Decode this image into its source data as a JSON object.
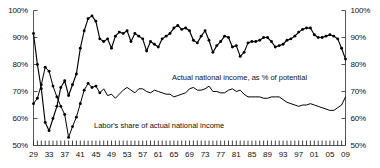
{
  "chart_data": {
    "type": "line",
    "title": "",
    "xlabel": "",
    "ylabel": "",
    "ylim": [
      50,
      100
    ],
    "xlim": [
      1929,
      2009
    ],
    "grid": false,
    "legend_position": "inline-annotation",
    "y_tick_labels": [
      "100%",
      "90%",
      "80%",
      "70%",
      "60%",
      "50%"
    ],
    "y_ticks": [
      100,
      90,
      80,
      70,
      60,
      50
    ],
    "y_axis_right_tick_labels": [
      "100%",
      "90%",
      "80%",
      "70%",
      "60%",
      "50%"
    ],
    "x_tick_labels": [
      "29",
      "33",
      "37",
      "41",
      "45",
      "49",
      "53",
      "57",
      "61",
      "65",
      "69",
      "73",
      "77",
      "81",
      "85",
      "89",
      "93",
      "97",
      "01",
      "05",
      "09"
    ],
    "x_ticks": [
      1929,
      1933,
      1937,
      1941,
      1945,
      1949,
      1953,
      1957,
      1961,
      1965,
      1969,
      1973,
      1977,
      1981,
      1985,
      1989,
      1993,
      1997,
      2001,
      2005,
      2009
    ],
    "minor_ticks": "annual",
    "annotations": [
      {
        "text": "Actual national income, as % of potential",
        "series": "actual_national_income"
      },
      {
        "text": "Labor's share of actual national income",
        "series": "labor_share"
      }
    ],
    "x": [
      1929,
      1930,
      1931,
      1932,
      1933,
      1934,
      1935,
      1936,
      1937,
      1938,
      1939,
      1940,
      1941,
      1942,
      1943,
      1944,
      1945,
      1946,
      1947,
      1948,
      1949,
      1950,
      1951,
      1952,
      1953,
      1954,
      1955,
      1956,
      1957,
      1958,
      1959,
      1960,
      1961,
      1962,
      1963,
      1964,
      1965,
      1966,
      1967,
      1968,
      1969,
      1970,
      1971,
      1972,
      1973,
      1974,
      1975,
      1976,
      1977,
      1978,
      1979,
      1980,
      1981,
      1982,
      1983,
      1984,
      1985,
      1986,
      1987,
      1988,
      1989,
      1990,
      1991,
      1992,
      1993,
      1994,
      1995,
      1996,
      1997,
      1998,
      1999,
      2000,
      2001,
      2002,
      2003,
      2004,
      2005,
      2006,
      2007,
      2008,
      2009
    ],
    "series": [
      {
        "name": "Actual national income, as % of potential",
        "marker": "filled-diamond",
        "values": [
          91.5,
          80.0,
          71.0,
          58.5,
          55.5,
          60.0,
          64.5,
          71.5,
          74.0,
          68.5,
          72.5,
          76.5,
          86.0,
          92.5,
          97.0,
          98.0,
          96.0,
          89.5,
          88.5,
          89.5,
          86.0,
          90.5,
          92.0,
          91.5,
          92.5,
          88.5,
          91.5,
          90.5,
          89.5,
          85.0,
          88.5,
          87.5,
          86.5,
          89.5,
          90.5,
          91.5,
          93.5,
          94.5,
          93.0,
          93.5,
          92.5,
          89.0,
          88.0,
          90.5,
          92.5,
          89.0,
          84.5,
          87.0,
          88.5,
          90.5,
          90.0,
          86.5,
          87.0,
          83.0,
          84.5,
          88.0,
          88.5,
          88.5,
          89.0,
          90.0,
          90.0,
          88.5,
          86.5,
          87.0,
          87.5,
          89.0,
          89.5,
          90.5,
          92.0,
          93.0,
          93.5,
          93.5,
          91.0,
          90.0,
          90.0,
          90.5,
          91.0,
          90.5,
          89.5,
          86.0,
          82.0
        ]
      },
      {
        "name": "Labor's share of actual national income",
        "marker": "filled-diamond-early",
        "values": [
          65.5,
          67.5,
          72.5,
          79.0,
          77.5,
          72.0,
          68.0,
          64.5,
          61.5,
          53.0,
          57.0,
          60.5,
          65.5,
          70.5,
          73.0,
          71.5,
          72.0,
          69.5,
          71.0,
          68.5,
          69.0,
          67.5,
          69.0,
          70.5,
          71.5,
          70.5,
          69.5,
          71.0,
          71.0,
          70.0,
          69.5,
          70.5,
          70.0,
          69.5,
          69.0,
          69.0,
          68.0,
          68.5,
          69.0,
          69.5,
          71.0,
          71.5,
          70.5,
          70.5,
          71.0,
          72.0,
          70.0,
          70.0,
          69.5,
          69.5,
          70.5,
          71.0,
          70.0,
          70.5,
          69.0,
          68.0,
          68.0,
          68.0,
          68.0,
          67.5,
          67.5,
          68.0,
          68.0,
          68.0,
          67.0,
          66.0,
          65.5,
          65.0,
          64.5,
          65.0,
          65.0,
          65.5,
          65.0,
          64.5,
          64.0,
          63.5,
          63.0,
          63.0,
          64.0,
          65.0,
          68.0
        ]
      }
    ]
  }
}
